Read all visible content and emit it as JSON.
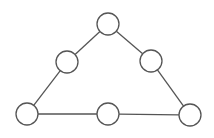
{
  "diagram": {
    "type": "graph",
    "colors": {
      "background": "#ffffff",
      "edge": "#555555",
      "node_stroke": "#555555",
      "node_fill": "#ffffff"
    },
    "node_radius": 11,
    "nodes": [
      {
        "id": "top",
        "x": 108,
        "y": 24,
        "label": ""
      },
      {
        "id": "left-mid",
        "x": 67,
        "y": 62,
        "label": ""
      },
      {
        "id": "right-mid",
        "x": 151,
        "y": 61,
        "label": ""
      },
      {
        "id": "bottom-left",
        "x": 27,
        "y": 114,
        "label": ""
      },
      {
        "id": "bottom-mid",
        "x": 108,
        "y": 114,
        "label": ""
      },
      {
        "id": "bottom-right",
        "x": 190,
        "y": 115,
        "label": ""
      }
    ],
    "edges": [
      {
        "from": "top",
        "to": "left-mid"
      },
      {
        "from": "top",
        "to": "right-mid"
      },
      {
        "from": "left-mid",
        "to": "bottom-left"
      },
      {
        "from": "right-mid",
        "to": "bottom-right"
      },
      {
        "from": "bottom-left",
        "to": "bottom-mid"
      },
      {
        "from": "bottom-mid",
        "to": "bottom-right"
      }
    ]
  }
}
